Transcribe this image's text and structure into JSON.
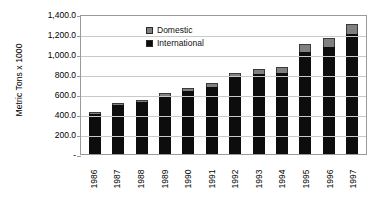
{
  "chart_data": {
    "type": "bar",
    "subtype": "stacked-vertical",
    "title": "",
    "xlabel": "",
    "ylabel": "Metric Tons x 1000",
    "ylim": [
      0,
      1400
    ],
    "ytick_values": [
      1400,
      1200,
      1000,
      800,
      600,
      400,
      200,
      0
    ],
    "ytick_labels": [
      "1,400.0",
      "1,200.0",
      "1,000.0",
      "800.0",
      "600.0",
      "400.0",
      "200.0",
      "-"
    ],
    "grid": true,
    "grid_axis": "y",
    "legend_position": "inside-top-left",
    "categories": [
      "1986",
      "1987",
      "1988",
      "1989",
      "1990",
      "1991",
      "1992",
      "1993",
      "1994",
      "1995",
      "1996",
      "1997"
    ],
    "series": [
      {
        "name": "International",
        "color": "#0d0d0d",
        "values": [
          405,
          490,
          520,
          585,
          630,
          675,
          770,
          805,
          810,
          1020,
          1075,
          1200
        ]
      },
      {
        "name": "Domestic",
        "color": "#808080",
        "values": [
          20,
          20,
          25,
          25,
          30,
          35,
          40,
          45,
          65,
          80,
          90,
          105
        ]
      }
    ],
    "totals": [
      425,
      510,
      545,
      610,
      660,
      710,
      810,
      850,
      875,
      1100,
      1165,
      1305
    ]
  },
  "legend": {
    "items": [
      {
        "label": "Domestic",
        "swatch": "gray-swatch-icon"
      },
      {
        "label": "International",
        "swatch": "black-swatch-icon"
      }
    ]
  },
  "axes": {
    "y_title": "Metric Tons x 1000"
  }
}
